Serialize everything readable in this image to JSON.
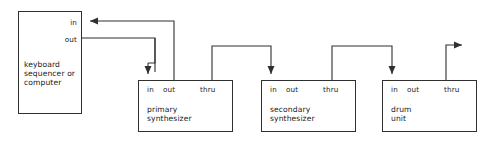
{
  "diagram": {
    "line_color": "#303030",
    "text_color": "#1a1a1a",
    "background": "#ffffff",
    "nodes": [
      {
        "id": "source",
        "title_lines": [
          "keyboard",
          "sequencer or",
          "computer"
        ],
        "ports": [
          {
            "name": "in",
            "label": "in"
          },
          {
            "name": "out",
            "label": "out"
          }
        ]
      },
      {
        "id": "primary-synthesizer",
        "title_lines": [
          "primary",
          "synthesizer"
        ],
        "ports": [
          {
            "name": "in",
            "label": "in"
          },
          {
            "name": "out",
            "label": "out"
          },
          {
            "name": "thru",
            "label": "thru"
          }
        ]
      },
      {
        "id": "secondary-synthesizer",
        "title_lines": [
          "secondary",
          "synthesizer"
        ],
        "ports": [
          {
            "name": "in",
            "label": "in"
          },
          {
            "name": "out",
            "label": "out"
          },
          {
            "name": "thru",
            "label": "thru"
          }
        ]
      },
      {
        "id": "drum-unit",
        "title_lines": [
          "drum",
          "unit"
        ],
        "ports": [
          {
            "name": "in",
            "label": "in"
          },
          {
            "name": "out",
            "label": "out"
          },
          {
            "name": "thru",
            "label": "thru"
          }
        ]
      }
    ],
    "connections": [
      {
        "from": "primary-synthesizer.out",
        "to": "source.in",
        "arrow": "left"
      },
      {
        "from": "source.out",
        "to": "primary-synthesizer.in",
        "arrow": "down"
      },
      {
        "from": "primary-synthesizer.thru",
        "to": "secondary-synthesizer.in",
        "arrow": "down"
      },
      {
        "from": "secondary-synthesizer.thru",
        "to": "drum-unit.in",
        "arrow": "down"
      },
      {
        "from": "drum-unit.thru",
        "to": "further-units",
        "arrow": "right"
      }
    ]
  }
}
